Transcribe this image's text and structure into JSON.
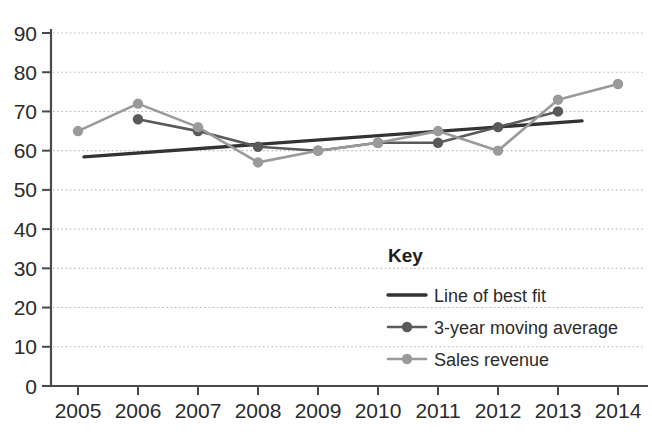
{
  "chart_data": {
    "type": "line",
    "title": "",
    "xlabel": "",
    "ylabel": "",
    "x": [
      2005,
      2006,
      2007,
      2008,
      2009,
      2010,
      2011,
      2012,
      2013,
      2014
    ],
    "categories": [
      "2005",
      "2006",
      "2007",
      "2008",
      "2009",
      "2010",
      "2011",
      "2012",
      "2013",
      "2014"
    ],
    "xlim": [
      2005,
      2014
    ],
    "ylim": [
      0,
      90
    ],
    "ytick_step": 10,
    "yticks": [
      "0",
      "10",
      "20",
      "30",
      "40",
      "50",
      "60",
      "70",
      "80",
      "90"
    ],
    "grid": true,
    "grid_axis": "y",
    "legend_position": "inside-lower-right",
    "series": [
      {
        "name": "Sales revenue",
        "style": "line-markers",
        "color": "#9a9a9a",
        "marker": "circle",
        "x": [
          2005,
          2006,
          2007,
          2008,
          2009,
          2010,
          2011,
          2012,
          2013,
          2014
        ],
        "values": [
          65,
          72,
          66,
          57,
          60,
          62,
          65,
          60,
          73,
          77
        ]
      },
      {
        "name": "3-year moving average",
        "style": "line-markers",
        "color": "#5a5a5a",
        "marker": "circle",
        "x": [
          2006,
          2007,
          2008,
          2009,
          2010,
          2011,
          2012,
          2013
        ],
        "values": [
          68,
          65,
          61,
          60,
          62,
          62,
          66,
          70
        ]
      },
      {
        "name": "Line of best fit",
        "style": "line",
        "color": "#333333",
        "marker": "none",
        "x": [
          2005.1,
          2013.4
        ],
        "values": [
          58.4,
          67.6
        ]
      }
    ]
  },
  "legend": {
    "title": "Key",
    "entries": [
      {
        "label": "Line of best fit",
        "color": "#333333",
        "marker": false
      },
      {
        "label": "3-year moving average",
        "color": "#5a5a5a",
        "marker": true
      },
      {
        "label": "Sales revenue",
        "color": "#9a9a9a",
        "marker": true
      }
    ]
  },
  "axes": {
    "axis_color": "#4a4a4a",
    "grid_color": "#b9b9c9"
  }
}
